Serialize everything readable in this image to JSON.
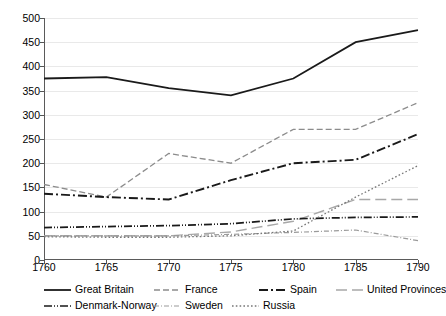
{
  "chart_data": {
    "type": "line",
    "title": "",
    "xlabel": "",
    "ylabel": "",
    "x": [
      1760,
      1765,
      1770,
      1775,
      1780,
      1785,
      1790
    ],
    "xticklabels": [
      "1760",
      "1765",
      "1770",
      "1775",
      "1780",
      "1785",
      "1790"
    ],
    "yticklabels": [
      "0",
      "50",
      "100",
      "150",
      "200",
      "250",
      "300",
      "350",
      "400",
      "450",
      "500"
    ],
    "yticks": [
      0,
      50,
      100,
      150,
      200,
      250,
      300,
      350,
      400,
      450,
      500
    ],
    "xlim": [
      1760,
      1790
    ],
    "ylim": [
      0,
      500
    ],
    "grid": "horizontal",
    "legend_position": "bottom",
    "series": [
      {
        "name": "Great Britain",
        "values": [
          375,
          378,
          355,
          340,
          375,
          450,
          475
        ],
        "style": "solid",
        "color": "#1a1a1a",
        "width": 1.8,
        "dash": ""
      },
      {
        "name": "France",
        "values": [
          156,
          130,
          220,
          200,
          270,
          270,
          325
        ],
        "style": "dashed",
        "color": "#8c8c8c",
        "width": 1.3,
        "dash": "6,3"
      },
      {
        "name": "Spain",
        "values": [
          137,
          130,
          125,
          165,
          200,
          207,
          260
        ],
        "style": "dash-dot",
        "color": "#1a1a1a",
        "width": 1.9,
        "dash": "9,3,2,3"
      },
      {
        "name": "United Provinces",
        "values": [
          50,
          50,
          50,
          58,
          80,
          125,
          125
        ],
        "style": "long-dash",
        "color": "#a8a8a8",
        "width": 1.4,
        "dash": "11,5"
      },
      {
        "name": "Denmark-Norway",
        "values": [
          67,
          69,
          71,
          75,
          85,
          88,
          89
        ],
        "style": "dash-dot-dot",
        "color": "#1a1a1a",
        "width": 1.7,
        "dash": "8,2,1,2,1,2"
      },
      {
        "name": "Sweden",
        "values": [
          50,
          50,
          50,
          53,
          57,
          62,
          40
        ],
        "style": "dash-dot-fine",
        "color": "#9a9a9a",
        "width": 1.2,
        "dash": "5,2,1,2"
      },
      {
        "name": "Russia",
        "values": [
          48,
          47,
          47,
          50,
          60,
          130,
          195
        ],
        "style": "dotted",
        "color": "#777777",
        "width": 1.3,
        "dash": "1.6,2.2"
      }
    ]
  },
  "legend": {
    "rows": [
      [
        "Great Britain",
        "France",
        "Spain",
        "United Provinces"
      ],
      [
        "Denmark-Norway",
        "Sweden",
        "Russia"
      ]
    ]
  }
}
